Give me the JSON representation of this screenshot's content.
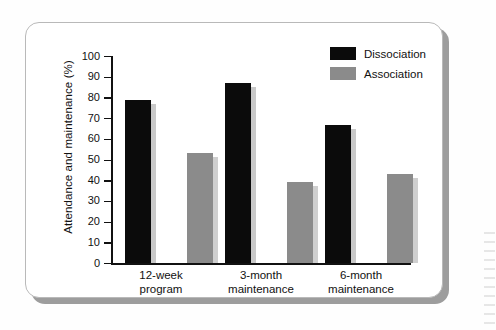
{
  "figure": {
    "background_color": "#fefefe",
    "card_color": "#ffffff",
    "card_border_color": "#b9b9b9",
    "shadow_color": "#9d9d9d"
  },
  "legend": {
    "position": "top-right",
    "entries": [
      {
        "label": "Dissociation",
        "color": "#0b0b0b",
        "swatch": "legend-swatch-dissociation"
      },
      {
        "label": "Association",
        "color": "#8b8b8b",
        "swatch": "legend-swatch-association"
      }
    ]
  },
  "chart_data": {
    "type": "bar",
    "title": "",
    "xlabel": "",
    "ylabel": "Attendance and maintenance (%)",
    "categories": [
      "12-week program",
      "3-month maintenance",
      "6-month maintenance"
    ],
    "category_lines": [
      [
        "12-week",
        "program"
      ],
      [
        "3-month",
        "maintenance"
      ],
      [
        "6-month",
        "maintenance"
      ]
    ],
    "series": [
      {
        "name": "Dissociation",
        "color": "#0b0b0b",
        "values": [
          79,
          87,
          66.5
        ]
      },
      {
        "name": "Association",
        "color": "#8b8b8b",
        "values": [
          53,
          39,
          43
        ]
      }
    ],
    "ylim": [
      0,
      100
    ],
    "ytick_values": [
      0,
      10,
      20,
      30,
      40,
      50,
      60,
      70,
      80,
      90,
      100
    ],
    "ytick_labels": [
      "0",
      "10",
      "20",
      "30",
      "40",
      "50",
      "60",
      "70",
      "80",
      "90",
      "100"
    ],
    "grid": false,
    "legend_position": "top-right"
  }
}
